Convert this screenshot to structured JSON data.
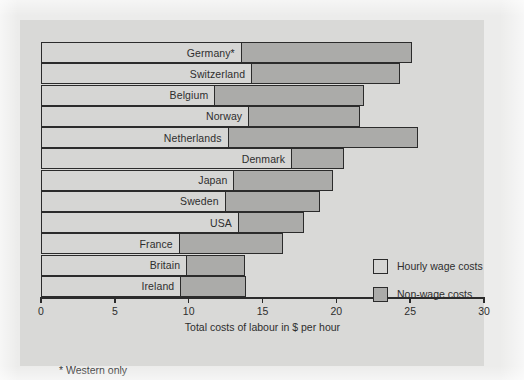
{
  "figure": {
    "footnote": "* Western only",
    "colors": {
      "page_background": "#ececeb",
      "panel_background": "#d9d9d7",
      "wage_fill": "#d6d6d4",
      "nonwage_fill": "#ababa9",
      "outline": "#2b2b2b",
      "text": "#2e2e2e"
    }
  },
  "chart_data": {
    "type": "bar",
    "orientation": "horizontal",
    "stacked": true,
    "title": "",
    "xlabel": "Total costs of labour in $ per hour",
    "ylabel": "",
    "xlim": [
      0,
      30
    ],
    "xticks": [
      0,
      5,
      10,
      15,
      20,
      25,
      30
    ],
    "xtick_labels": [
      "0",
      "5",
      "10",
      "15",
      "20",
      "25",
      "30"
    ],
    "grid": false,
    "legend_position": "inside-right",
    "legend": [
      "Hourly wage costs",
      "Non-wage costs"
    ],
    "categories": [
      "Germany*",
      "Switzerland",
      "Belgium",
      "Norway",
      "Netherlands",
      "Denmark",
      "Japan",
      "Sweden",
      "USA",
      "France",
      "Britain",
      "Ireland"
    ],
    "series": [
      {
        "name": "Hourly wage costs",
        "color": "#d6d6d4",
        "values": [
          13.6,
          14.3,
          11.8,
          14.1,
          12.7,
          17.0,
          13.1,
          12.5,
          13.4,
          9.4,
          9.9,
          9.5
        ]
      },
      {
        "name": "Non-wage costs",
        "color": "#ababa9",
        "values": [
          11.5,
          10.0,
          10.1,
          7.5,
          12.8,
          3.5,
          6.7,
          6.4,
          4.4,
          7.0,
          3.9,
          4.4
        ]
      }
    ],
    "totals": [
      25.1,
      24.3,
      21.9,
      21.6,
      25.5,
      20.5,
      19.8,
      18.9,
      17.8,
      16.4,
      13.8,
      13.9
    ]
  }
}
